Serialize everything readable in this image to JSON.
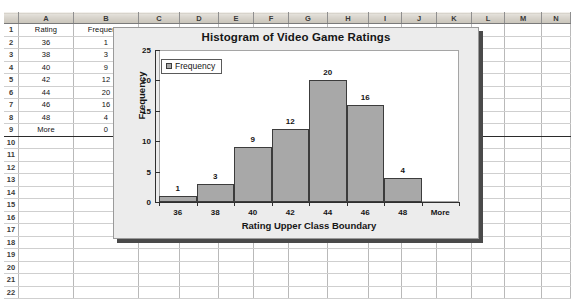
{
  "spreadsheet": {
    "column_headers": [
      "A",
      "B",
      "C",
      "D",
      "E",
      "F",
      "G",
      "H",
      "I",
      "J",
      "K",
      "L",
      "M",
      "N"
    ],
    "row_numbers": [
      "1",
      "2",
      "3",
      "4",
      "5",
      "6",
      "7",
      "8",
      "9",
      "10",
      "11",
      "12",
      "13",
      "14",
      "15",
      "16",
      "17",
      "18",
      "19",
      "20",
      "21",
      "22"
    ],
    "header_row": {
      "a": "Rating",
      "b": "Frequency"
    },
    "rows": [
      {
        "a": "36",
        "b": "1"
      },
      {
        "a": "38",
        "b": "3"
      },
      {
        "a": "40",
        "b": "9"
      },
      {
        "a": "42",
        "b": "12"
      },
      {
        "a": "44",
        "b": "20"
      },
      {
        "a": "46",
        "b": "16"
      },
      {
        "a": "48",
        "b": "4"
      },
      {
        "a": "More",
        "b": "0"
      }
    ]
  },
  "chart_data": {
    "type": "bar",
    "title": "Histogram of Video Game Ratings",
    "xlabel": "Rating Upper Class Boundary",
    "ylabel": "Frequency",
    "categories": [
      "36",
      "38",
      "40",
      "42",
      "44",
      "46",
      "48",
      "More"
    ],
    "values": [
      1,
      3,
      9,
      12,
      20,
      16,
      4,
      0
    ],
    "data_labels": [
      "1",
      "3",
      "9",
      "12",
      "20",
      "16",
      "4",
      ""
    ],
    "ylim": [
      0,
      25
    ],
    "yticks": [
      "0",
      "5",
      "10",
      "15",
      "20",
      "25"
    ],
    "grid": false,
    "legend": {
      "position": "top-left",
      "entries": [
        "Frequency"
      ]
    },
    "series_color": "#a8a8a8",
    "series_border_color": "#3c3c3c"
  }
}
